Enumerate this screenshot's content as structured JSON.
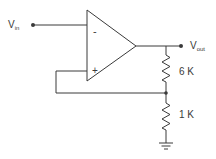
{
  "diagram": {
    "type": "non-inverting-amplifier-schematic",
    "colors": {
      "stroke": "#3a3a3a",
      "background": "#ffffff"
    },
    "input": {
      "label_main": "V",
      "label_sub": "in"
    },
    "output": {
      "label_main": "V",
      "label_sub": "out"
    },
    "opamp": {
      "inverting_sign": "-",
      "noninverting_sign": "+"
    },
    "resistors": [
      {
        "id": "R1",
        "label": "6 K"
      },
      {
        "id": "R2",
        "label": "1 K"
      }
    ],
    "ground": {
      "symbol": "ground"
    }
  }
}
